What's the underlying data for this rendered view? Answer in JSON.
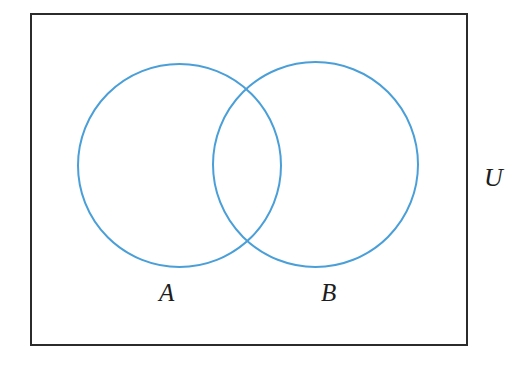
{
  "figure": {
    "kind": "venn-diagram",
    "width": 531,
    "height": 368,
    "background_color": "#ffffff"
  },
  "universe": {
    "label": "U",
    "shape": "rectangle",
    "stroke_color": "#2b2b2b",
    "stroke_width": 2,
    "fill": "none",
    "x": 31,
    "y": 14,
    "width": 436,
    "height": 331,
    "label_x": 495,
    "label_y": 180
  },
  "sets": [
    {
      "label": "A",
      "shape": "circle",
      "cx": 179.5,
      "cy": 165.5,
      "r": 101.5,
      "stroke_color": "#4a9fd8",
      "stroke_width": 2,
      "fill": "none",
      "label_x": 168,
      "label_y": 293
    },
    {
      "label": "B",
      "shape": "circle",
      "cx": 315.5,
      "cy": 164.5,
      "r": 102.5,
      "stroke_color": "#4a9fd8",
      "stroke_width": 2,
      "fill": "none",
      "label_x": 331,
      "label_y": 293
    }
  ],
  "intersection": {
    "upper_point_x": 248,
    "upper_point_y": 88,
    "lower_point_x": 248,
    "lower_point_y": 245,
    "shaded": false
  },
  "colors": {
    "set_stroke": "#4a9fd8",
    "universe_stroke": "#2b2b2b",
    "label_text": "#1d1d1d",
    "background": "#ffffff"
  }
}
